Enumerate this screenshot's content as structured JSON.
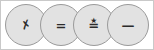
{
  "figure": {
    "type": "node-chain",
    "background_color": "#ffffff",
    "frame_border_color": "#c9c9c9",
    "node_fill_color": "#e2e2e2",
    "node_stroke_color": "#9a9a9a",
    "glyph_color": "#2b2b2b",
    "node_count": 4,
    "node_diameter_px": 42,
    "nodes": [
      {
        "name": "node-1",
        "glyph": "✗",
        "glyph_name": "cross-mark-glyph",
        "center_x": 26,
        "center_y": 25
      },
      {
        "name": "node-2",
        "glyph": "=",
        "glyph_name": "equals-glyph",
        "center_x": 61,
        "center_y": 25
      },
      {
        "name": "node-3",
        "glyph": "≛",
        "glyph_name": "perpendicular-glyph",
        "center_x": 94,
        "center_y": 25
      },
      {
        "name": "node-4",
        "glyph": "—",
        "glyph_name": "dash-glyph",
        "center_x": 128,
        "center_y": 25
      }
    ]
  }
}
